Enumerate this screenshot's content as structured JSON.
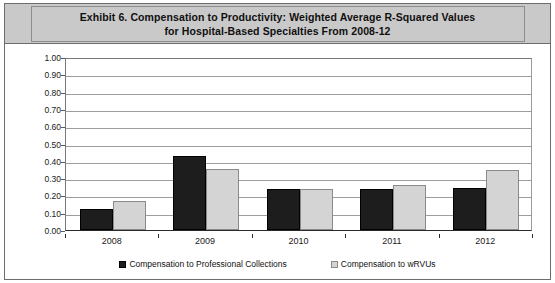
{
  "exhibit": {
    "title_line_1": "Exhibit 6. Compensation to Productivity: Weighted Average R-Squared Values",
    "title_line_2": "for Hospital-Based Specialties From 2008-12"
  },
  "chart_data": {
    "type": "bar",
    "title": "Exhibit 6. Compensation to Productivity: Weighted Average R-Squared Values for Hospital-Based Specialties From 2008-12",
    "xlabel": "",
    "ylabel": "",
    "ylim": [
      0.0,
      1.0
    ],
    "ytick_step": 0.1,
    "grid": true,
    "legend_position": "bottom",
    "categories": [
      "2008",
      "2009",
      "2010",
      "2011",
      "2012"
    ],
    "ytick_labels": [
      "1.00",
      "0.90",
      "0.80",
      "0.70",
      "0.60",
      "0.50",
      "0.40",
      "0.30",
      "0.20",
      "0.10",
      "0.00"
    ],
    "series": [
      {
        "name": "Compensation to Professional Collections",
        "color": "#1d1d1d",
        "values": [
          0.12,
          0.43,
          0.235,
          0.235,
          0.24
        ]
      },
      {
        "name": "Compensation to wRVUs",
        "color": "#d4d4d4",
        "values": [
          0.165,
          0.35,
          0.235,
          0.26,
          0.345
        ]
      }
    ]
  }
}
